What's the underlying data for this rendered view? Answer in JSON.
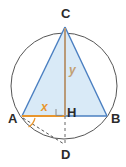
{
  "figure": {
    "width": 126,
    "height": 167,
    "background": "#ffffff"
  },
  "colors": {
    "circle_stroke": "#555555",
    "triangle_stroke": "#4a7fc1",
    "triangle_fill": "#d9eaf7",
    "altitude_stroke": "#b99a78",
    "segment_x_stroke": "#e8962e",
    "base_stroke": "#4a7fc1",
    "dashed_stroke": "#666666",
    "angle_arc_stroke": "#e8962e",
    "right_angle_stroke": "#8a8a8a",
    "point_label_color": "#2b2b2b",
    "x_label_color": "#e8962e",
    "y_label_color": "#c2a074"
  },
  "points": {
    "C": {
      "label": "C",
      "x": 65,
      "y": 27
    },
    "A": {
      "label": "A",
      "x": 22,
      "y": 116
    },
    "B": {
      "label": "B",
      "x": 107,
      "y": 116
    },
    "H": {
      "label": "H",
      "x": 65,
      "y": 116
    },
    "D": {
      "label": "D",
      "x": 65,
      "y": 145
    }
  },
  "labels": {
    "C": "C",
    "A": "A",
    "B": "B",
    "H": "H",
    "D": "D",
    "x": "x",
    "y": "y"
  },
  "circle": {
    "cx": 64,
    "cy": 86,
    "r": 53
  },
  "segments": {
    "x_segment": {
      "from": "A",
      "to": "H",
      "label": "x"
    },
    "y_segment": {
      "from": "C",
      "to": "H",
      "label": "y"
    }
  },
  "markers": {
    "right_angle_at": "H",
    "angle_arc_at": "A",
    "dashed_chord": {
      "from": "A",
      "to": "D"
    },
    "dashed_altitude_extension": {
      "from": "H",
      "to": "D"
    }
  }
}
